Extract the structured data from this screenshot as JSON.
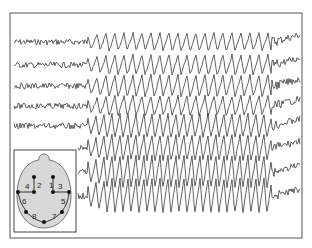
{
  "figure": {
    "type": "eeg-recording",
    "frame_color": "#555555",
    "trace_color": "#3a3a3a",
    "background": "#ffffff"
  },
  "traces": {
    "count": 8,
    "baselines": [
      42,
      65,
      86,
      106,
      126,
      148,
      172,
      196
    ],
    "onset_x": 88,
    "offset_x": 272,
    "pre_amplitude": [
      3,
      3,
      3,
      3,
      3,
      3,
      3,
      3
    ],
    "ictal_amplitude": [
      9,
      10,
      11,
      10,
      12,
      13,
      16,
      17
    ],
    "ictal_period": [
      9,
      9,
      9,
      9,
      8,
      8,
      8,
      8
    ]
  },
  "inset": {
    "title": "electrode-montage",
    "head_color": "#d8d8d8",
    "channels": [
      {
        "num": "1",
        "from": "front-right",
        "to": "mid-right"
      },
      {
        "num": "2",
        "from": "front-left",
        "to": "mid-left"
      },
      {
        "num": "3",
        "from": "mid-right",
        "to": "lateral-right"
      },
      {
        "num": "4",
        "from": "mid-left",
        "to": "lateral-left"
      },
      {
        "num": "5",
        "from": "lateral-right",
        "to": "posterior-right"
      },
      {
        "num": "6",
        "from": "lateral-left",
        "to": "posterior-left"
      },
      {
        "num": "7",
        "from": "posterior-right",
        "to": "occipital"
      },
      {
        "num": "8",
        "from": "posterior-left",
        "to": "occipital"
      }
    ],
    "labels": [
      "1",
      "2",
      "3",
      "4",
      "5",
      "6",
      "7",
      "8"
    ]
  }
}
